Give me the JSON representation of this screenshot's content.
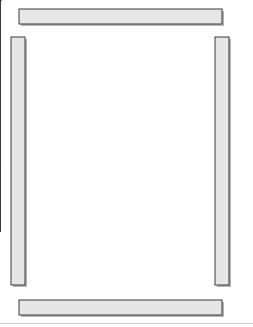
{
  "canvas": {
    "width": 253,
    "height": 327,
    "background": "#ffffff",
    "title": "quilt-assembly-diagram"
  },
  "palette": {
    "fabric_fill": "#e8e8e8",
    "piece_line": "#3a3a3a",
    "block_outline": "#555555",
    "sash_fill": "#e6e6e6",
    "sash_outline": "#3a3a3a",
    "shadow": "#b4b4b4",
    "page_rule": "#cccccc"
  },
  "geometry": {
    "row": {
      "x": 33,
      "width": 177,
      "height": 62
    },
    "row_tops": [
      31,
      98,
      165,
      232
    ],
    "block_size": 22.125,
    "blocks_per_row": 8,
    "block_rows": 1
  },
  "sashes": {
    "top": {
      "x": 19,
      "y": 9,
      "width": 203,
      "height": 15
    },
    "bottom": {
      "x": 19,
      "y": 300,
      "width": 203,
      "height": 15
    },
    "left": {
      "x": 11,
      "y": 37,
      "width": 14,
      "height": 248
    },
    "right": {
      "x": 215,
      "y": 37,
      "width": 14,
      "height": 248
    }
  },
  "page_rule": {
    "x": 0,
    "y": 323,
    "width": 253,
    "height": 1
  },
  "parts": [
    {
      "name": "top-border-strip",
      "label": "top border strip"
    },
    {
      "name": "bottom-border-strip",
      "label": "bottom border strip"
    },
    {
      "name": "left-border-strip",
      "label": "left border strip"
    },
    {
      "name": "right-border-strip",
      "label": "right border strip"
    },
    {
      "name": "block-row-1",
      "label": "block row 1"
    },
    {
      "name": "block-row-2",
      "label": "block row 2"
    },
    {
      "name": "block-row-3",
      "label": "block row 3"
    },
    {
      "name": "block-row-4",
      "label": "block row 4"
    }
  ],
  "block_types": {
    "star": "sawtooth-star-block",
    "diamond": "square-in-a-square-block"
  },
  "rows": [
    {
      "name": "block-row-1",
      "pattern": [
        "star",
        "diamond",
        "star",
        "diamond",
        "star",
        "diamond",
        "star",
        "diamond"
      ]
    },
    {
      "name": "block-row-2",
      "pattern": [
        "star",
        "diamond",
        "star",
        "diamond",
        "star",
        "diamond",
        "star",
        "diamond"
      ]
    },
    {
      "name": "block-row-3",
      "pattern": [
        "star",
        "diamond",
        "star",
        "diamond",
        "star",
        "diamond",
        "star",
        "diamond"
      ]
    },
    {
      "name": "block-row-4",
      "pattern": [
        "star",
        "diamond",
        "star",
        "diamond",
        "star",
        "diamond",
        "star",
        "diamond"
      ]
    }
  ]
}
